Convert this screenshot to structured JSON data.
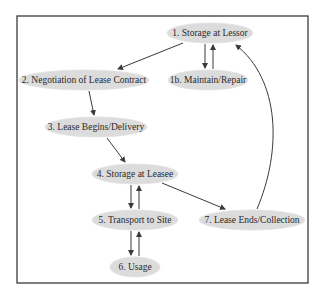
{
  "diagram": {
    "title": "",
    "frame": {
      "x": 17,
      "y": 16,
      "width": 291,
      "height": 267,
      "stroke": "#3a3a3a",
      "stroke_width": 1.3
    },
    "style": {
      "node_fill": "#dcdcdc",
      "node_stroke": "#e2e2e2",
      "edge_color": "#3a3a3a",
      "text_color": "#2a2a2a"
    },
    "nodes": [
      {
        "id": "n1",
        "label": "1. Storage at Lessor",
        "cx": 210,
        "cy": 33,
        "rx": 43,
        "ry": 10
      },
      {
        "id": "n2",
        "label": "2. Negotiation of Lease Contract",
        "cx": 84,
        "cy": 80,
        "rx": 65,
        "ry": 10
      },
      {
        "id": "n1b",
        "label": "1b. Maintain/Repair",
        "cx": 208,
        "cy": 80,
        "rx": 40,
        "ry": 10
      },
      {
        "id": "n3",
        "label": "3. Lease Begins/Delivery",
        "cx": 96,
        "cy": 127,
        "rx": 51,
        "ry": 10
      },
      {
        "id": "n4",
        "label": "4. Storage at Leasee",
        "cx": 135,
        "cy": 174,
        "rx": 43,
        "ry": 10
      },
      {
        "id": "n5",
        "label": "5. Transport to Site",
        "cx": 135,
        "cy": 220,
        "rx": 43,
        "ry": 10
      },
      {
        "id": "n7",
        "label": "7. Lease Ends/Collection",
        "cx": 252,
        "cy": 220,
        "rx": 53,
        "ry": 10
      },
      {
        "id": "n6",
        "label": "6. Usage",
        "cx": 135,
        "cy": 267,
        "rx": 25,
        "ry": 10
      }
    ],
    "edges": [
      {
        "from": "n1",
        "to": "n2",
        "path": "M183,43 L118,69"
      },
      {
        "from": "n1",
        "to": "n1b",
        "path": "M205,44 L205,68"
      },
      {
        "from": "n1b",
        "to": "n1",
        "path": "M213,69 L213,45"
      },
      {
        "from": "n2",
        "to": "n3",
        "path": "M89,91 L94,115"
      },
      {
        "from": "n3",
        "to": "n4",
        "path": "M107,138 L125,162"
      },
      {
        "from": "n4",
        "to": "n5",
        "path": "M131,185 L131,208"
      },
      {
        "from": "n5",
        "to": "n4",
        "path": "M139,209 L139,186"
      },
      {
        "from": "n4",
        "to": "n7",
        "path": "M162,183 L225,209"
      },
      {
        "from": "n5",
        "to": "n6",
        "path": "M131,231 L131,255"
      },
      {
        "from": "n6",
        "to": "n5",
        "path": "M139,256 L139,232"
      },
      {
        "from": "n7",
        "to": "n1",
        "path": "M257,209 C 282,150 280,80 236,45"
      }
    ]
  }
}
